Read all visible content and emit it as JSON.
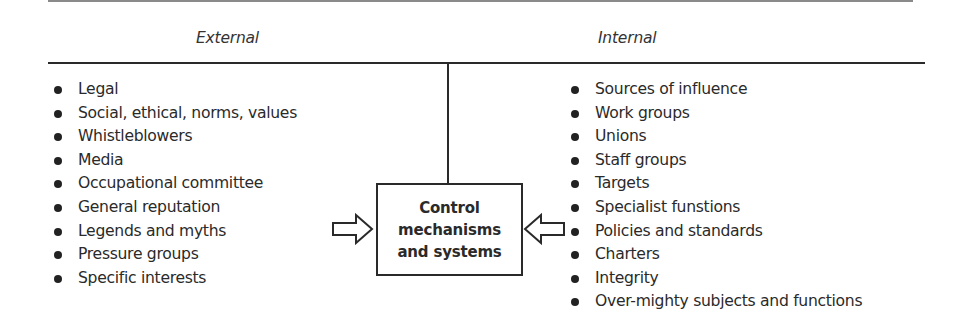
{
  "headings": {
    "external": "External",
    "internal": "Internal"
  },
  "external_items": [
    "Legal",
    "Social, ethical, norms, values",
    "Whistleblowers",
    "Media",
    "Occupational committee",
    "General reputation",
    "Legends and myths",
    "Pressure groups",
    "Specific interests"
  ],
  "internal_items": [
    "Sources of influence",
    "Work groups",
    "Unions",
    "Staff groups",
    "Targets",
    "Specialist funstions",
    "Policies and standards",
    "Charters",
    "Integrity",
    "Over-mighty subjects and functions"
  ],
  "center_box": {
    "line1": "Control",
    "line2": "mechanisms",
    "line3": "and systems"
  },
  "icons": {
    "left_arrow": "arrow-right-outline-icon",
    "right_arrow": "arrow-left-outline-icon",
    "bullet": "bullet-dot-icon"
  },
  "colors": {
    "line": "#2a2a2a",
    "text": "#2a2a2a",
    "background": "#ffffff"
  }
}
